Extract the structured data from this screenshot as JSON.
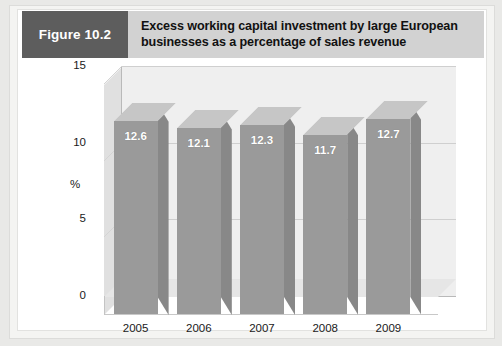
{
  "figure": {
    "tag_label": "Figure 10.2",
    "title": "Excess working capital investment by large European businesses as a percentage of sales revenue",
    "tag_bg_color": "#5d5d5d",
    "header_bg_color": "#d2d2d2"
  },
  "chart_data": {
    "type": "bar",
    "title": "Excess working capital investment by large European businesses as a percentage of sales revenue",
    "xlabel": "",
    "ylabel": "%",
    "categories": [
      "2005",
      "2006",
      "2007",
      "2008",
      "2009"
    ],
    "values": [
      12.6,
      12.1,
      12.3,
      11.7,
      12.7
    ],
    "data_labels": [
      "12.6",
      "12.1",
      "12.3",
      "11.7",
      "12.7"
    ],
    "ylim": [
      0,
      15
    ],
    "y_ticks": [
      0,
      5,
      10,
      15
    ],
    "y_tick_labels": [
      "0",
      "5",
      "10",
      "15"
    ],
    "grid": true,
    "grid_axis": "y",
    "legend": false,
    "three_d": true,
    "series": [
      {
        "name": "Excess working capital investment",
        "values": [
          12.6,
          12.1,
          12.3,
          11.7,
          12.7
        ]
      }
    ],
    "colors": {
      "bar_front": "#9a9a9a",
      "bar_top": "#c6c6c6",
      "bar_side": "#888888",
      "back_wall": "#efefef",
      "floor": "#e6e6e6",
      "gridline": "#cfcfcf"
    }
  }
}
